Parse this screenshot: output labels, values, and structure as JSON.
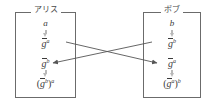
{
  "diagram": {
    "type": "diffie-hellman-key-exchange",
    "background_color": "#ffffff",
    "line_color": "#6b6b6b",
    "text_color": "#3a3a3a",
    "step_arrow_color": "#b9b9b9"
  },
  "alice": {
    "label": "アリス",
    "terms": {
      "secret": "a",
      "public": "g",
      "public_exp": "a",
      "received": "g",
      "received_exp": "b",
      "shared_open": "(",
      "shared_base": "g",
      "shared_inner_exp": "b",
      "shared_close": ")",
      "shared_outer_exp": "a"
    }
  },
  "bob": {
    "label": "ボブ",
    "terms": {
      "secret": "b",
      "public": "g",
      "public_exp": "b",
      "received": "g",
      "received_exp": "a",
      "shared_open": "(",
      "shared_base": "g",
      "shared_inner_exp": "a",
      "shared_close": ")",
      "shared_outer_exp": "b"
    }
  },
  "arrows": {
    "alice_to_bob": "g^a sent to Bob",
    "bob_to_alice": "g^b sent to Alice"
  }
}
